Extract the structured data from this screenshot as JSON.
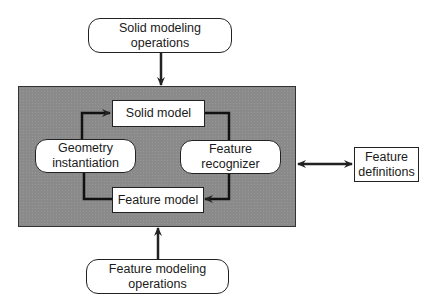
{
  "diagram": {
    "nodes": {
      "solid_ops": {
        "label_line1": "Solid modeling",
        "label_line2": "operations",
        "shape": "rounded"
      },
      "solid_model": {
        "label": "Solid model",
        "shape": "rectangle"
      },
      "geometry": {
        "label_line1": "Geometry",
        "label_line2": "instantiation",
        "shape": "rounded"
      },
      "recognizer": {
        "label_line1": "Feature",
        "label_line2": "recognizer",
        "shape": "rounded"
      },
      "feature_model": {
        "label": "Feature model",
        "shape": "rectangle"
      },
      "definitions": {
        "label_line1": "Feature",
        "label_line2": "definitions",
        "shape": "rectangle"
      },
      "feature_ops": {
        "label_line1": "Feature modeling",
        "label_line2": "operations",
        "shape": "rounded"
      }
    },
    "edges": [
      {
        "from": "Solid modeling operations",
        "to": "core system",
        "type": "arrow"
      },
      {
        "from": "Geometry instantiation",
        "to": "Solid model",
        "type": "arrow"
      },
      {
        "from": "Solid model",
        "to": "Feature recognizer",
        "type": "line"
      },
      {
        "from": "Feature recognizer",
        "to": "Feature model",
        "type": "arrow"
      },
      {
        "from": "Feature model",
        "to": "Geometry instantiation",
        "type": "line"
      },
      {
        "from": "core system",
        "to": "Feature definitions",
        "type": "double-arrow"
      },
      {
        "from": "Feature modeling operations",
        "to": "core system",
        "type": "arrow"
      }
    ],
    "colors": {
      "core_fill": "#8a8a8a",
      "stroke": "#222222",
      "node_fill": "#ffffff"
    }
  }
}
